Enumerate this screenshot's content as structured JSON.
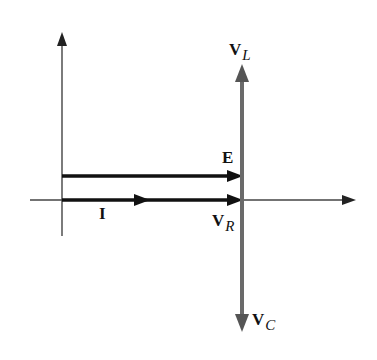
{
  "diagram": {
    "type": "phasor-diagram",
    "labels": {
      "VL": {
        "main": "V",
        "sub": "L"
      },
      "E": {
        "main": "E"
      },
      "I": {
        "main": "I"
      },
      "VR": {
        "main": "V",
        "sub": "R"
      },
      "VC": {
        "main": "V",
        "sub": "C"
      }
    },
    "colors": {
      "axes": "#333333",
      "phasor_dark": "#111111",
      "phasor_gray": "#6a6a6a"
    }
  }
}
